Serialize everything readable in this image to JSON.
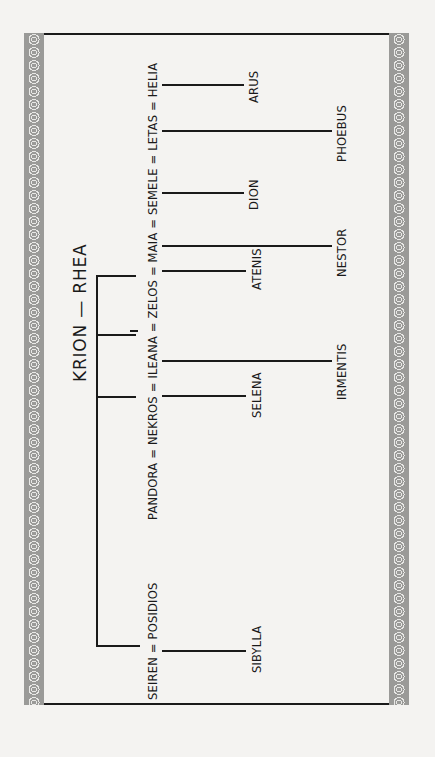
{
  "diagram": {
    "type": "family-tree",
    "orientation": "rotated-90-ccw",
    "title": "KRION — RHEA",
    "generation_1": {
      "parents": [
        "KRION",
        "RHEA"
      ]
    },
    "generation_2": {
      "couples_line_upper": "PANDORA = NEKROS = ILEANA = ZELOS = MAIA = SEMELE = LETAS = HELIA",
      "couples_line_lower": "SEIREN = POSIDIOS",
      "members": [
        "PANDORA",
        "NEKROS",
        "ILEANA",
        "ZELOS",
        "MAIA",
        "SEMELE",
        "LETAS",
        "HELIA",
        "SEIREN",
        "POSIDIOS"
      ]
    },
    "generation_3": {
      "children": [
        {
          "name": "ARUS"
        },
        {
          "name": "PHOEBUS"
        },
        {
          "name": "DION"
        },
        {
          "name": "NESTOR"
        },
        {
          "name": "ATENIS"
        },
        {
          "name": "IRMENTIS"
        },
        {
          "name": "SELENA"
        },
        {
          "name": "SIBYLLA"
        }
      ]
    }
  },
  "colors": {
    "background": "#f4f3f1",
    "border": "#9a9a98",
    "ink": "#1a1a1a"
  }
}
